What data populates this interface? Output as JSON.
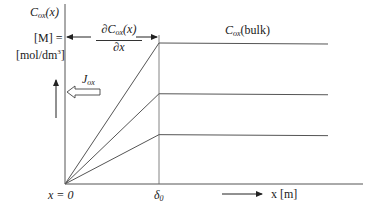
{
  "diagram": {
    "y_axis_label": {
      "main": "C",
      "sub": "ox",
      "arg": "(x)"
    },
    "unit_label_line1": "[M] =",
    "unit_label_line2": "[mol/dm",
    "unit_label_sup": "3",
    "unit_label_end": "]",
    "gradient_label": {
      "num_d": "∂C",
      "num_sub": "ox",
      "num_arg": "(x)",
      "den": "∂x"
    },
    "bulk_label": {
      "main": "C",
      "sub": "ox",
      "arg": "(bulk)"
    },
    "flux_label": {
      "main": "J",
      "sub": "ox"
    },
    "origin_label": "x = 0",
    "delta_label": {
      "main": "δ",
      "sub": "0"
    },
    "x_axis_label": "x [m]",
    "profiles": [
      {
        "name": "high-concentration",
        "plateau_fraction": 1.0
      },
      {
        "name": "mid-concentration",
        "plateau_fraction": 0.64
      },
      {
        "name": "low-concentration",
        "plateau_fraction": 0.35
      }
    ],
    "colors": {
      "line": "#555555",
      "text": "#1a1a1a"
    }
  }
}
